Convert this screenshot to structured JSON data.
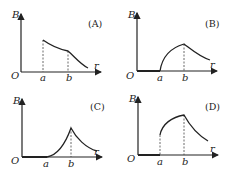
{
  "figure": {
    "axis_labels": {
      "y": "B",
      "x": "r",
      "origin": "O"
    },
    "tick_labels": {
      "a": "a",
      "b": "b"
    },
    "panels": [
      {
        "id": "A",
        "label": "(A)",
        "description": "B=0 for r<a; jumps to max at a, decreases to b with slight flattening, then decreases further"
      },
      {
        "id": "B",
        "label": "(B)",
        "description": "B=0 for r<a; rises concavely from a to peak at b, then decreases"
      },
      {
        "id": "C",
        "label": "(C)",
        "description": "B=0 for r<a; rises convexly from a to sharp peak at b, then decreases"
      },
      {
        "id": "D",
        "label": "(D)",
        "description": "B=0 for r<a; jumps at a to nonzero value, rises to max at b, then decreases"
      }
    ]
  }
}
